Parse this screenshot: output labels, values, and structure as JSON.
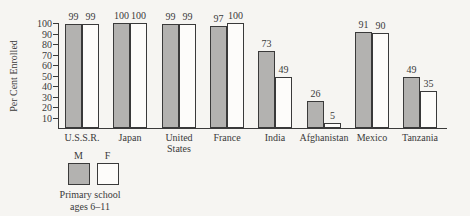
{
  "figure": {
    "background_color": "#f6f5f2",
    "ink_color": "#3a3a3a"
  },
  "chart_data": {
    "type": "bar",
    "title": "",
    "xlabel": "",
    "ylabel": "Per Cent Enrolled",
    "ylim": [
      0,
      100
    ],
    "yticks": [
      10,
      20,
      30,
      40,
      50,
      60,
      70,
      80,
      90,
      100
    ],
    "grid": false,
    "bar_value_labels": true,
    "legend_position": "bottom-left",
    "categories": [
      "U.S.S.R.",
      "Japan",
      "United States",
      "France",
      "India",
      "Afghanistan",
      "Mexico",
      "Tanzania"
    ],
    "series": [
      {
        "name": "M",
        "color": "#b3b2b0",
        "values": [
          99,
          100,
          99,
          97,
          73,
          26,
          91,
          49
        ]
      },
      {
        "name": "F",
        "color": "#fdfcfa",
        "values": [
          99,
          100,
          99,
          100,
          49,
          5,
          90,
          35
        ]
      }
    ],
    "legend": {
      "m_label": "M",
      "f_label": "F",
      "caption_line1": "Primary school",
      "caption_line2": "ages 6–11"
    }
  }
}
